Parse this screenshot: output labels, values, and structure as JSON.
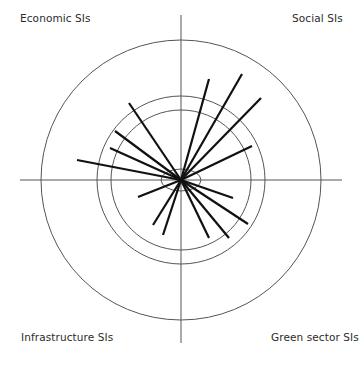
{
  "diagram": {
    "type": "quadrant-radial",
    "center": {
      "x": 181,
      "y": 180
    },
    "colors": {
      "axis": "#555555",
      "circle": "#555555",
      "spoke": "#111111",
      "text": "#2b2b2b"
    },
    "quadrant_labels": {
      "top_left": "Economic SIs",
      "top_right": "Social SIs",
      "bottom_left": "Infrastructure SIs",
      "bottom_right": "Green sector SIs"
    },
    "circles": [
      {
        "name": "outer",
        "r": 140
      },
      {
        "name": "middle",
        "r": 84
      },
      {
        "name": "inner",
        "r": 70
      }
    ],
    "center_ellipse": {
      "rx": 20,
      "ry": 11
    },
    "spokes": {
      "economic": [
        [
          129,
          103
        ],
        [
          115,
          131
        ],
        [
          110,
          148
        ],
        [
          77,
          160
        ]
      ],
      "social": [
        [
          209,
          79
        ],
        [
          242,
          74
        ],
        [
          261,
          98
        ],
        [
          252,
          146
        ]
      ],
      "infrastructure": [
        [
          138,
          197
        ],
        [
          153,
          225
        ],
        [
          163,
          235
        ]
      ],
      "green_sector": [
        [
          233,
          198
        ],
        [
          248,
          224
        ],
        [
          229,
          238
        ],
        [
          209,
          238
        ]
      ]
    }
  }
}
